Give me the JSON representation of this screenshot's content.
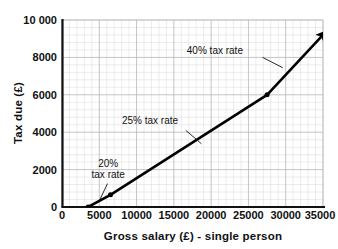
{
  "chart_data": {
    "type": "line",
    "title": "",
    "xlabel": "Gross salary (£) - single person",
    "ylabel": "Tax due (£)",
    "xlim": [
      0,
      35000
    ],
    "ylim": [
      0,
      10000
    ],
    "grid": true,
    "grid_style": "graph-paper",
    "legend": "none",
    "x_ticks": [
      {
        "value": 0,
        "label": "0"
      },
      {
        "value": 5000,
        "label": "5000"
      },
      {
        "value": 10000,
        "label": "10000"
      },
      {
        "value": 15000,
        "label": "15000"
      },
      {
        "value": 20000,
        "label": "20000"
      },
      {
        "value": 25000,
        "label": "25000"
      },
      {
        "value": 30000,
        "label": "30000"
      },
      {
        "value": 35000,
        "label": "35000"
      }
    ],
    "y_ticks": [
      {
        "value": 0,
        "label": "0"
      },
      {
        "value": 2000,
        "label": "2000"
      },
      {
        "value": 4000,
        "label": "4000"
      },
      {
        "value": 6000,
        "label": "6000"
      },
      {
        "value": 8000,
        "label": "8000"
      },
      {
        "value": 10000,
        "label": "10 000"
      }
    ],
    "series": [
      {
        "name": "Tax due",
        "color": "#000000",
        "line_width": 2.6,
        "arrow_end": true,
        "x": [
          3500,
          6500,
          27500,
          35000
        ],
        "y": [
          0,
          650,
          6000,
          9200
        ],
        "markers_at": [
          {
            "x": 3500,
            "y": 0
          },
          {
            "x": 6500,
            "y": 650
          },
          {
            "x": 27500,
            "y": 6000
          }
        ]
      }
    ],
    "annotations": [
      {
        "id": "rate-20",
        "text_lines": [
          "20%",
          "tax rate"
        ],
        "text_x": 6200,
        "text_y": 2150,
        "leader_from": {
          "x": 6100,
          "y": 1250
        },
        "leader_to": {
          "x": 5000,
          "y": 330
        }
      },
      {
        "id": "rate-25",
        "text_lines": [
          "25% tax rate"
        ],
        "text_x": 11800,
        "text_y": 4450,
        "leader_from": {
          "x": 16600,
          "y": 4100
        },
        "leader_to": {
          "x": 18700,
          "y": 3380
        }
      },
      {
        "id": "rate-40",
        "text_lines": [
          "40% tax rate"
        ],
        "text_x": 20500,
        "text_y": 8200,
        "leader_from": {
          "x": 26900,
          "y": 8000
        },
        "leader_to": {
          "x": 29600,
          "y": 7450
        }
      }
    ]
  },
  "colors": {
    "line": "#000000",
    "axis": "#111111",
    "grid_minor": "#d8d8d8",
    "grid_major": "#b9b9b9",
    "background": "#ffffff",
    "text": "#111111"
  }
}
